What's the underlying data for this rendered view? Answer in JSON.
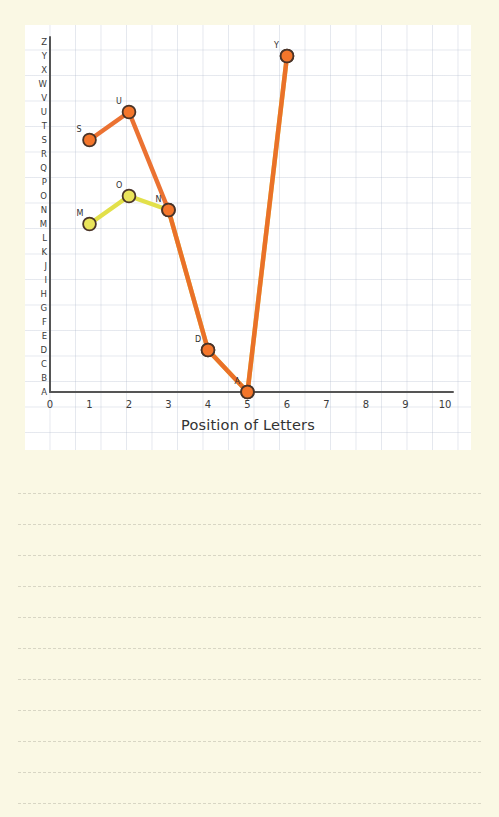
{
  "page": {
    "background_color": "#faf8e4",
    "panel_color": "#ffffff",
    "grid_color": "#aab4c8"
  },
  "chart_data": {
    "type": "line",
    "title": "",
    "xlabel": "Position of Letters",
    "ylabel": "",
    "grid": true,
    "legend": "none",
    "xlim": [
      0,
      10
    ],
    "xticks": [
      "0",
      "1",
      "2",
      "3",
      "4",
      "5",
      "6",
      "7",
      "8",
      "9",
      "10"
    ],
    "yticks": [
      "Z",
      "Y",
      "X",
      "W",
      "V",
      "U",
      "T",
      "S",
      "R",
      "Q",
      "P",
      "O",
      "N",
      "M",
      "L",
      "K",
      "J",
      "I",
      "H",
      "G",
      "F",
      "E",
      "D",
      "C",
      "B",
      "A"
    ],
    "ylim": [
      "A",
      "Z"
    ],
    "categories": [
      1,
      2,
      3,
      4,
      5,
      6
    ],
    "series": [
      {
        "name": "SUNDAY",
        "color": "#ea6a27",
        "marker_fill": "#f4762b",
        "marker_stroke": "#4a3428",
        "x": [
          1,
          2,
          3,
          4,
          5,
          6
        ],
        "letters": [
          "S",
          "U",
          "N",
          "D",
          "A",
          "Y"
        ],
        "values": [
          19,
          21,
          14,
          4,
          1,
          25
        ]
      },
      {
        "name": "MONDAY",
        "color": "#e2e04a",
        "marker_fill": "#eae45c",
        "marker_stroke": "#4a3428",
        "x": [
          1,
          2,
          3,
          4,
          5,
          6
        ],
        "letters": [
          "M",
          "O",
          "N",
          "D",
          "A",
          "Y"
        ],
        "values": [
          13,
          15,
          14,
          4,
          1,
          25
        ]
      }
    ],
    "point_labels": [
      {
        "text": "S",
        "x": 1,
        "letter": "S"
      },
      {
        "text": "U",
        "x": 2,
        "letter": "U"
      },
      {
        "text": "N",
        "x": 3,
        "letter": "N"
      },
      {
        "text": "D",
        "x": 4,
        "letter": "D"
      },
      {
        "text": "A",
        "x": 5,
        "letter": "A"
      },
      {
        "text": "Y",
        "x": 6,
        "letter": "Y"
      },
      {
        "text": "M",
        "x": 1,
        "letter": "M"
      },
      {
        "text": "O",
        "x": 2,
        "letter": "O"
      }
    ]
  },
  "notes": {
    "line_count": 11,
    "line_color": "#d8d6c4"
  }
}
